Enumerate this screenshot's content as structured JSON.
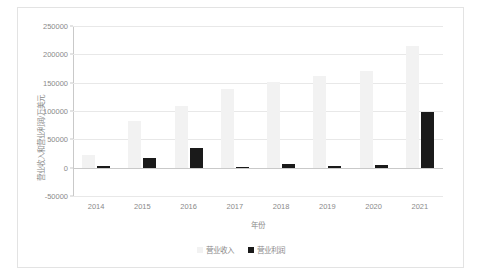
{
  "chart_data": {
    "type": "bar",
    "title": "",
    "xlabel": "年份",
    "ylabel": "营业收入和营业利润/万美元",
    "categories": [
      "2014",
      "2015",
      "2016",
      "2017",
      "2018",
      "2019",
      "2020",
      "2021"
    ],
    "series": [
      {
        "name": "营业收入",
        "color": "#f2f2f2",
        "values": [
          21900,
          81700,
          108900,
          139500,
          151200,
          162500,
          170800,
          214600
        ]
      },
      {
        "name": "营业利润",
        "color": "#1a1a1a",
        "values": [
          2100,
          16600,
          35000,
          500,
          6500,
          3300,
          4200,
          97400
        ]
      }
    ],
    "yticks": [
      -50000,
      0,
      50000,
      100000,
      150000,
      200000,
      250000
    ],
    "ylim": [
      -50000,
      250000
    ],
    "grid": true,
    "legend_position": "bottom"
  },
  "legend": {
    "items": [
      {
        "label": "营业收入",
        "color": "#f2f2f2"
      },
      {
        "label": "营业利润",
        "color": "#1a1a1a"
      }
    ]
  }
}
